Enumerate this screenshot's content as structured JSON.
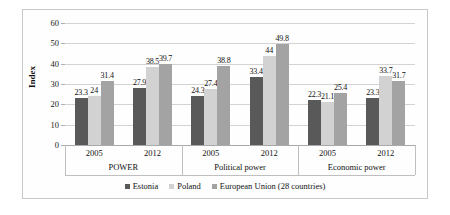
{
  "chart_data": {
    "type": "bar",
    "title": "",
    "xlabel": "",
    "ylabel": "Index",
    "ylim": [
      0,
      60
    ],
    "ytick_step": 10,
    "yticks": [
      0,
      10,
      20,
      30,
      40,
      50,
      60
    ],
    "grid": true,
    "legend_position": "bottom",
    "group_labels": [
      "POWER",
      "Political power",
      "Economic power"
    ],
    "categories": [
      "2005",
      "2012",
      "2005",
      "2012",
      "2005",
      "2012"
    ],
    "series": [
      {
        "name": "Estonia",
        "color": "#595959",
        "values": [
          23.3,
          27.9,
          24.3,
          33.4,
          22.3,
          23.3
        ]
      },
      {
        "name": "Poland",
        "color": "#d2d2d2",
        "values": [
          24,
          38.5,
          27.4,
          44,
          21.1,
          33.7
        ]
      },
      {
        "name": "European Union (28 countries)",
        "color": "#a3a3a3",
        "values": [
          31.4,
          39.7,
          38.8,
          49.8,
          25.4,
          31.7
        ]
      }
    ],
    "data_labels": [
      [
        "23.3",
        "27.9",
        "24.3",
        "33.4",
        "22.3",
        "23.3"
      ],
      [
        "24",
        "38.5",
        "27.4",
        "44",
        "21.1",
        "33.7"
      ],
      [
        "31.4",
        "39.7",
        "38.8",
        "49.8",
        "25.4",
        "31.7"
      ]
    ]
  }
}
